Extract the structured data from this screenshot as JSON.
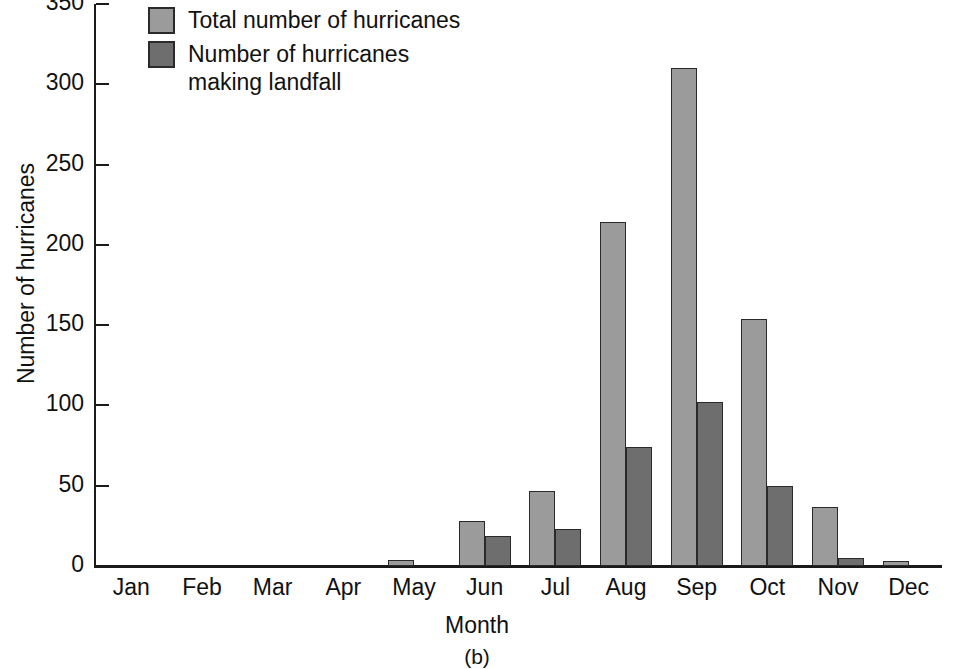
{
  "chart_data": {
    "type": "bar",
    "title": "",
    "xlabel": "Month",
    "ylabel": "Number of hurricanes",
    "caption": "(b)",
    "categories": [
      "Jan",
      "Feb",
      "Mar",
      "Apr",
      "May",
      "Jun",
      "Jul",
      "Aug",
      "Sep",
      "Oct",
      "Nov",
      "Dec"
    ],
    "series": [
      {
        "name": "Total number of hurricanes",
        "color": "#9b9b9b",
        "values": [
          0,
          0,
          0,
          0,
          4,
          28,
          47,
          214,
          310,
          154,
          37,
          3
        ]
      },
      {
        "name": "Number of hurricanes\nmaking landfall",
        "color": "#6e6e6e",
        "values": [
          0,
          0,
          0,
          0,
          0,
          19,
          23,
          74,
          102,
          50,
          5,
          0
        ]
      }
    ],
    "ylim": [
      0,
      350
    ],
    "yticks": [
      0,
      50,
      100,
      150,
      200,
      250,
      300,
      350
    ],
    "ytick_labels": [
      "0",
      "50",
      "100",
      "150",
      "200",
      "250",
      "300",
      "350"
    ],
    "grid": false,
    "legend_position": "top-left"
  },
  "legend": {
    "items": [
      {
        "label": "Total number of hurricanes",
        "swatch": "total"
      },
      {
        "label": "Number of hurricanes\nmaking landfall",
        "swatch": "landfall"
      }
    ]
  },
  "axes": {
    "y_title": "Number of hurricanes",
    "x_title": "Month",
    "caption": "(b)"
  }
}
